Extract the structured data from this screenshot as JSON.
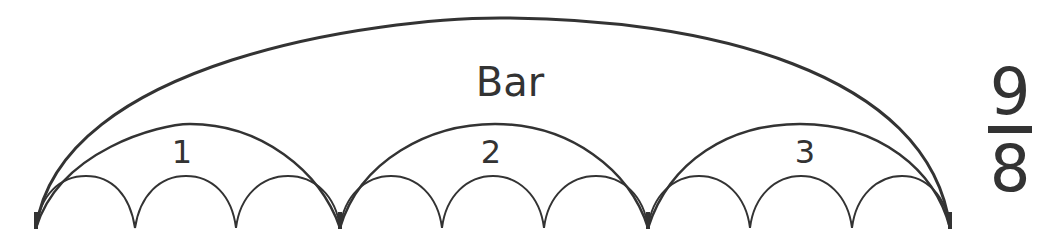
{
  "diagram": {
    "bar_label": "Bar",
    "beats": [
      {
        "label": "1",
        "subdivisions": 3
      },
      {
        "label": "2",
        "subdivisions": 3
      },
      {
        "label": "3",
        "subdivisions": 3
      }
    ],
    "time_signature": {
      "numerator": "9",
      "denominator": "8"
    },
    "colors": {
      "stroke": "#333333",
      "background": "#ffffff"
    }
  }
}
